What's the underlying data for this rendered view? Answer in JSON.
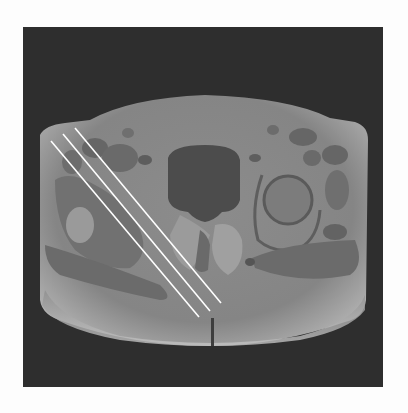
{
  "image": {
    "description": "Axial T1-weighted MRI of the pelvis at hip level with three parallel white planning lines across the left side of the image",
    "colors": {
      "page_background": "#fdfdfd",
      "frame_background": "#2e2e2e",
      "body_tissue": "#8a8a8a",
      "subcutaneous_fat": "#a9a9a9",
      "muscle": "#6b6b6b",
      "bladder": "#4a4a4a",
      "planning_line": "#ffffff"
    },
    "planning_lines": [
      {
        "x1": 51,
        "y1": 141,
        "x2": 199,
        "y2": 317
      },
      {
        "x1": 63,
        "y1": 134,
        "x2": 210,
        "y2": 311
      },
      {
        "x1": 75,
        "y1": 128,
        "x2": 221,
        "y2": 303
      }
    ]
  }
}
